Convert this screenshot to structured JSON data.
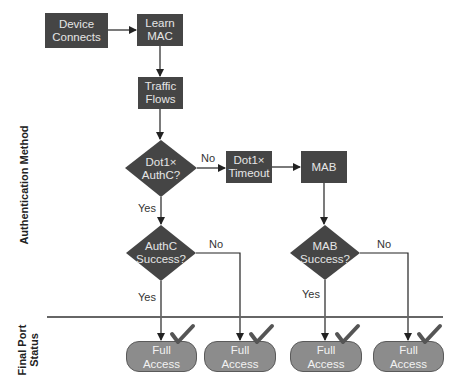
{
  "diagram": {
    "side_labels": {
      "authentication_method": "Authentication Method",
      "final_port_status": "Final Port\nStatus"
    },
    "nodes": {
      "device_connects": "Device\nConnects",
      "learn_mac": "Learn\nMAC",
      "traffic_flows": "Traffic\nFlows",
      "dot1x_authc": "Dot1×\nAuthC?",
      "dot1x_timeout": "Dot1×\nTimeout",
      "mab": "MAB",
      "authc_success": "AuthC\nSuccess?",
      "mab_success": "MAB\nSuccess?"
    },
    "edge_labels": {
      "dot1x_no": "No",
      "dot1x_yes": "Yes",
      "authc_no": "No",
      "authc_yes": "Yes",
      "mab_no": "No",
      "mab_yes": "Yes"
    },
    "outcomes": [
      {
        "label": "Full\nAccess",
        "status": "check"
      },
      {
        "label": "Full\nAccess",
        "status": "check"
      },
      {
        "label": "Full\nAccess",
        "status": "check"
      },
      {
        "label": "Full\nAccess",
        "status": "check"
      }
    ],
    "colors": {
      "process_fill": "#454545",
      "outcome_fill": "#8c8c8c",
      "line": "#333333",
      "separator": "#666666",
      "check": "#555555"
    }
  }
}
